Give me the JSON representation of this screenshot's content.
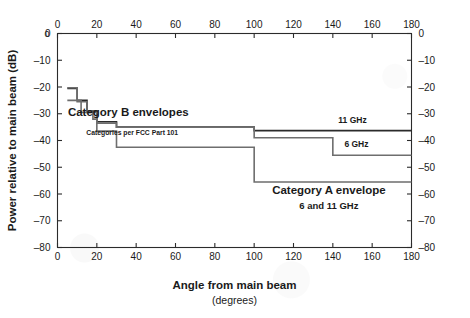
{
  "chart_data": {
    "type": "line",
    "title": "",
    "xlabel": "Angle from main beam",
    "xlabel_sub": "(degrees)",
    "ylabel": "Power relative to main beam (dB)",
    "xlim": [
      0,
      180
    ],
    "ylim": [
      -80,
      0
    ],
    "grid": false,
    "legend_position": "inline-annotations",
    "axes": {
      "x_ticks": [
        0,
        20,
        40,
        60,
        80,
        100,
        120,
        140,
        160,
        180
      ],
      "x_tick_labels": [
        "0",
        "20",
        "40",
        "60",
        "80",
        "100",
        "120",
        "140",
        "160",
        "180"
      ],
      "y_ticks": [
        0,
        -10,
        -20,
        -30,
        -40,
        -50,
        -60,
        -70,
        -80
      ],
      "y_tick_labels": [
        "0",
        "–10",
        "–20",
        "–30",
        "–40",
        "–50",
        "–60",
        "–70",
        "–80"
      ],
      "top_axis": true,
      "right_axis": true,
      "x_minor_ticks": [
        10,
        30,
        50,
        70,
        90,
        110,
        130,
        150,
        170
      ],
      "y_minor_ticks": [
        -5,
        -15,
        -25,
        -35,
        -45,
        -55,
        -65,
        -75
      ]
    },
    "series": [
      {
        "name": "Category B 11 GHz",
        "style": "step",
        "color": "#2b2b2b",
        "width": 1.6,
        "points": [
          {
            "x": 5,
            "y": -20.5
          },
          {
            "x": 10,
            "y": -20.5
          },
          {
            "x": 10,
            "y": -25.0
          },
          {
            "x": 15,
            "y": -25.0
          },
          {
            "x": 15,
            "y": -29.0
          },
          {
            "x": 20,
            "y": -29.0
          },
          {
            "x": 20,
            "y": -33.0
          },
          {
            "x": 30,
            "y": -33.0
          },
          {
            "x": 30,
            "y": -35.0
          },
          {
            "x": 100,
            "y": -35.0
          },
          {
            "x": 100,
            "y": -36.3
          },
          {
            "x": 180,
            "y": -36.3
          }
        ]
      },
      {
        "name": "Category B 6 GHz",
        "style": "step",
        "color": "#6e6e6e",
        "width": 1.6,
        "points": [
          {
            "x": 5,
            "y": -20.3
          },
          {
            "x": 10,
            "y": -20.3
          },
          {
            "x": 10,
            "y": -25.5
          },
          {
            "x": 15,
            "y": -25.5
          },
          {
            "x": 15,
            "y": -29.5
          },
          {
            "x": 20,
            "y": -29.5
          },
          {
            "x": 20,
            "y": -33.5
          },
          {
            "x": 30,
            "y": -33.5
          },
          {
            "x": 30,
            "y": -35.0
          },
          {
            "x": 100,
            "y": -35.0
          },
          {
            "x": 100,
            "y": -39.0
          },
          {
            "x": 140,
            "y": -39.0
          },
          {
            "x": 140,
            "y": -45.5
          },
          {
            "x": 180,
            "y": -45.5
          }
        ]
      },
      {
        "name": "Category A envelope 6 and 11 GHz",
        "style": "step",
        "color": "#6e6e6e",
        "width": 1.6,
        "points": [
          {
            "x": 5,
            "y": -25.0
          },
          {
            "x": 12,
            "y": -25.0
          },
          {
            "x": 12,
            "y": -29.5
          },
          {
            "x": 18,
            "y": -29.5
          },
          {
            "x": 18,
            "y": -32.0
          },
          {
            "x": 20,
            "y": -32.0
          },
          {
            "x": 20,
            "y": -36.5
          },
          {
            "x": 30,
            "y": -36.5
          },
          {
            "x": 30,
            "y": -42.5
          },
          {
            "x": 100,
            "y": -42.5
          },
          {
            "x": 100,
            "y": -55.5
          },
          {
            "x": 180,
            "y": -55.5
          }
        ]
      }
    ],
    "annotations": [
      {
        "id": "cat-b-label",
        "text": "Category B envelopes",
        "x": 36,
        "y": -31.0,
        "weight": "bold",
        "size": 11.5
      },
      {
        "id": "fcc-note",
        "text": "Categories per FCC Part 101",
        "x": 38,
        "y": -38.0,
        "weight": "bold",
        "size": 6.8
      },
      {
        "id": "ghz-11-label",
        "text": "11 GHz",
        "x": 150,
        "y": -33.4,
        "weight": "bold",
        "size": 8.5
      },
      {
        "id": "ghz-6-label",
        "text": "6 GHz",
        "x": 152,
        "y": -42.4,
        "weight": "bold",
        "size": 8.5
      },
      {
        "id": "cat-a-label",
        "text": "Category A envelope",
        "x": 138,
        "y": -60.0,
        "weight": "bold",
        "size": 11.5
      },
      {
        "id": "cat-a-sub",
        "text": "6 and 11 GHz",
        "x": 138,
        "y": -65.5,
        "weight": "bold",
        "size": 9.5
      }
    ]
  }
}
